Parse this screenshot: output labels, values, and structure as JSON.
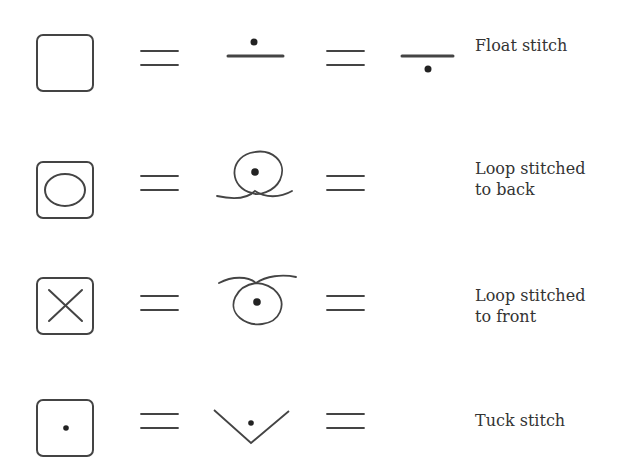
{
  "diagram": {
    "stroke_color": "#444444",
    "dot_color": "#222222",
    "rows": [
      {
        "id": "float",
        "label": "Float stitch",
        "box_symbol": "empty-square",
        "stitch_symbol": "line-with-dot-above",
        "alt_symbol": "line-with-dot-below"
      },
      {
        "id": "loop-back",
        "label": "Loop stitched\nto back",
        "box_symbol": "square-with-ellipse",
        "stitch_symbol": "loop-crossing-below",
        "alt_symbol": null
      },
      {
        "id": "loop-front",
        "label": "Loop stitched\nto front",
        "box_symbol": "square-with-x",
        "stitch_symbol": "loop-crossing-above",
        "alt_symbol": null
      },
      {
        "id": "tuck",
        "label": "Tuck stitch",
        "box_symbol": "square-with-dot",
        "stitch_symbol": "v-with-dot",
        "alt_symbol": null
      }
    ],
    "equals_sign": "="
  }
}
